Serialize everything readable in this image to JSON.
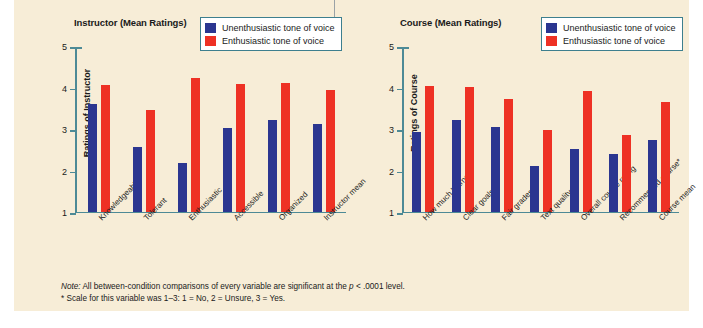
{
  "figure": {
    "background_color": "#f7edd7",
    "note_line1_prefix": "Note:",
    "note_line1": " All between-condition comparisons of every variable are significant at the ",
    "note_line1_stat": "p",
    "note_line1_suffix": " < .0001 level.",
    "note_line2": "* Scale for this variable was 1–3:  1 = No,  2 = Unsure,  3 = Yes."
  },
  "legend": {
    "series": [
      {
        "label": "Unenthusiastic tone of voice",
        "color": "#2b3690"
      },
      {
        "label": "Enthusiastic tone of voice",
        "color": "#ee3124"
      }
    ]
  },
  "chart_data": [
    {
      "type": "bar",
      "title": "Instructor (Mean Ratings)",
      "xlabel": "",
      "ylabel": "Ratings of Instructor",
      "ylim": [
        1,
        5
      ],
      "yticks": [
        1,
        2,
        3,
        4,
        5
      ],
      "grid": false,
      "legend_position": "top-right",
      "categories": [
        "Knowledgeable",
        "Tolerant",
        "Enthusiastic",
        "Accessible",
        "Organized",
        "Instructor mean"
      ],
      "series": [
        {
          "name": "Unenthusiastic tone of voice",
          "color": "#2b3690",
          "values": [
            3.62,
            2.58,
            2.17,
            3.03,
            3.22,
            3.12
          ]
        },
        {
          "name": "Enthusiastic tone of voice",
          "color": "#ee3124",
          "values": [
            4.08,
            3.48,
            4.24,
            4.09,
            4.12,
            3.95
          ]
        }
      ]
    },
    {
      "type": "bar",
      "title": "Course (Mean Ratings)",
      "xlabel": "",
      "ylabel": "Ratings of Course",
      "ylim": [
        1,
        5
      ],
      "yticks": [
        1,
        2,
        3,
        4,
        5
      ],
      "grid": false,
      "legend_position": "top-right",
      "categories": [
        "How much learned",
        "Clear goals",
        "Fair grades",
        "Text quality",
        "Overall course rating",
        "Recommended course*",
        "Course mean"
      ],
      "series": [
        {
          "name": "Unenthusiastic tone of voice",
          "color": "#2b3690",
          "values": [
            2.94,
            3.23,
            3.06,
            2.11,
            2.53,
            2.41,
            2.75
          ]
        },
        {
          "name": "Enthusiastic tone of voice",
          "color": "#ee3124",
          "values": [
            4.05,
            4.02,
            3.73,
            2.99,
            3.93,
            2.85,
            3.67
          ]
        }
      ]
    }
  ]
}
